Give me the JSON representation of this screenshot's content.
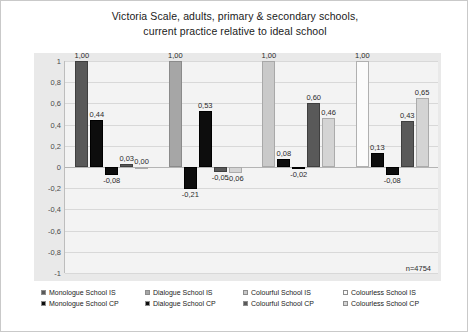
{
  "chart_data": {
    "type": "bar",
    "title": "Victoria Scale, adults, primary & secondary schools, current practice relative to ideal school",
    "title_lines": [
      "Victoria Scale, adults, primary & secondary schools,",
      "current practice relative to ideal school"
    ],
    "xlabel": "",
    "ylabel": "",
    "ylim": [
      -1,
      1
    ],
    "yticks": [
      "1",
      "0,8",
      "0,6",
      "0,4",
      "0,2",
      "0",
      "-0,2",
      "-0,4",
      "-0,6",
      "-0,8",
      "-1"
    ],
    "ytick_values": [
      1,
      0.8,
      0.6,
      0.4,
      0.2,
      0,
      -0.2,
      -0.4,
      -0.6,
      -0.8,
      -1
    ],
    "grid": true,
    "legend_position": "bottom",
    "annotation": "n=4754",
    "categories": [
      "Monologue",
      "Dialogue",
      "Colourful",
      "Colourless"
    ],
    "series": [
      {
        "name": "Monologue School IS",
        "color": "#595959",
        "values": [
          1.0,
          null,
          null,
          null
        ],
        "labels": [
          "1,00",
          "",
          "",
          ""
        ]
      },
      {
        "name": "Monologue  School CP",
        "color": "#0d0d0d",
        "values": [
          0.44,
          -0.21,
          0.08,
          0.13
        ],
        "labels": [
          "0,44",
          "-0,21",
          "0,08",
          "0,13"
        ]
      },
      {
        "name": "Dialogue School IS",
        "color": "#a6a6a6",
        "values": [
          null,
          1.0,
          null,
          null
        ],
        "labels": [
          "",
          "1,00",
          "",
          ""
        ]
      },
      {
        "name": "Dialogue  School CP",
        "color": "#0d0d0d",
        "values": [
          -0.08,
          0.53,
          -0.02,
          -0.08
        ],
        "labels": [
          "-0,08",
          "0,53",
          "-0,02",
          "-0,08"
        ]
      },
      {
        "name": "Colourful School IS",
        "color": "#c9c9c9",
        "values": [
          null,
          null,
          1.0,
          null
        ],
        "labels": [
          "",
          "",
          "1,00",
          ""
        ]
      },
      {
        "name": "Colourful  School CP",
        "color": "#595959",
        "values": [
          0.03,
          -0.05,
          0.6,
          0.43
        ],
        "labels": [
          "0,03",
          "-0,05",
          "0,60",
          "0,43"
        ]
      },
      {
        "name": "Colourless School IS",
        "color": "#fbfbfb",
        "values": [
          null,
          null,
          null,
          1.0
        ],
        "labels": [
          "",
          "",
          "",
          "1,00"
        ]
      },
      {
        "name": "Colourless  School CP",
        "color": "#d4d4d4",
        "values": [
          0.0,
          -0.06,
          0.46,
          0.65
        ],
        "labels": [
          "0,00",
          "-0,06",
          "0,46",
          "0,65"
        ]
      }
    ],
    "groups": [
      {
        "name": "Monologue",
        "bars": [
          {
            "series": "Monologue School IS",
            "value": 1.0,
            "label": "1,00",
            "style": "s-mono-is"
          },
          {
            "series": "Monologue  School CP",
            "value": 0.44,
            "label": "0,44",
            "style": "s-mono-cp"
          },
          {
            "series": "Dialogue  School CP",
            "value": -0.08,
            "label": "-0,08",
            "style": "s-dia-cp"
          },
          {
            "series": "Colourful  School CP",
            "value": 0.03,
            "label": "0,03",
            "style": "s-col-cp"
          },
          {
            "series": "Colourless  School CP",
            "value": 0.0,
            "label": "0,00",
            "style": "s-cls-cp"
          }
        ]
      },
      {
        "name": "Dialogue",
        "bars": [
          {
            "series": "Dialogue School IS",
            "value": 1.0,
            "label": "1,00",
            "style": "s-dia-is"
          },
          {
            "series": "Monologue  School CP",
            "value": -0.21,
            "label": "-0,21",
            "style": "s-mono-cp"
          },
          {
            "series": "Dialogue  School CP",
            "value": 0.53,
            "label": "0,53",
            "style": "s-dia-cp"
          },
          {
            "series": "Colourful  School CP",
            "value": -0.05,
            "label": "-0,05",
            "style": "s-col-cp"
          },
          {
            "series": "Colourless  School CP",
            "value": -0.06,
            "label": "-0,06",
            "style": "s-cls-cp"
          }
        ]
      },
      {
        "name": "Colourful",
        "bars": [
          {
            "series": "Colourful School IS",
            "value": 1.0,
            "label": "1,00",
            "style": "s-col-is"
          },
          {
            "series": "Monologue  School CP",
            "value": 0.08,
            "label": "0,08",
            "style": "s-mono-cp"
          },
          {
            "series": "Dialogue  School CP",
            "value": -0.02,
            "label": "-0,02",
            "style": "s-dia-cp"
          },
          {
            "series": "Colourful  School CP",
            "value": 0.6,
            "label": "0,60",
            "style": "s-col-cp"
          },
          {
            "series": "Colourless  School CP",
            "value": 0.46,
            "label": "0,46",
            "style": "s-cls-cp"
          }
        ]
      },
      {
        "name": "Colourless",
        "bars": [
          {
            "series": "Colourless School IS",
            "value": 1.0,
            "label": "1,00",
            "style": "s-cls-is"
          },
          {
            "series": "Monologue  School CP",
            "value": 0.13,
            "label": "0,13",
            "style": "s-mono-cp"
          },
          {
            "series": "Dialogue  School CP",
            "value": -0.08,
            "label": "-0,08",
            "style": "s-dia-cp"
          },
          {
            "series": "Colourful  School CP",
            "value": 0.43,
            "label": "0,43",
            "style": "s-col-cp"
          },
          {
            "series": "Colourless  School CP",
            "value": 0.65,
            "label": "0,65",
            "style": "s-cls-cp"
          }
        ]
      }
    ]
  },
  "legend": {
    "rows": [
      [
        {
          "label": "Monologue School IS",
          "style": "s-mono-is"
        },
        {
          "label": "Dialogue School IS",
          "style": "s-dia-is"
        },
        {
          "label": "Colourful School IS",
          "style": "s-col-is"
        },
        {
          "label": "Colourless School IS",
          "style": "s-cls-is"
        }
      ],
      [
        {
          "label": "Monologue  School CP",
          "style": "s-mono-cp"
        },
        {
          "label": "Dialogue  School CP",
          "style": "s-dia-cp"
        },
        {
          "label": "Colourful  School CP",
          "style": "s-col-cp"
        },
        {
          "label": "Colourless  School CP",
          "style": "s-cls-cp"
        }
      ]
    ]
  }
}
